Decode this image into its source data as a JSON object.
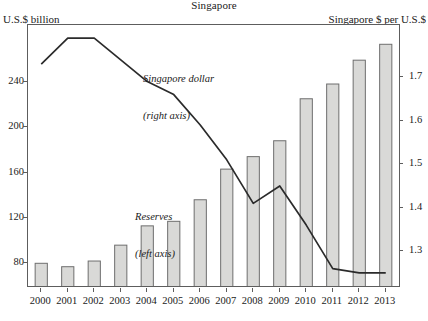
{
  "header": {
    "title": "Singapore",
    "left_axis_label": "U.S.$ billion",
    "right_axis_label": "Singapore $ per U.S.$"
  },
  "annotations": {
    "line_series": "Singapore dollar",
    "line_series_axis": "(right axis)",
    "bar_series": "Reserves",
    "bar_series_axis": "(left axis)"
  },
  "colors": {
    "bar_fill": "#d9d9d7",
    "bar_stroke": "#6e6e6e",
    "line_stroke": "#2b2b2b",
    "frame": "#5d5d5d",
    "text": "#1a1a1a"
  },
  "chart_data": {
    "type": "bar",
    "title": "Singapore",
    "xlabel": "",
    "ylabel": "U.S.$ billion",
    "y2label": "Singapore $ per U.S.$",
    "grid": false,
    "legend": "inline-annotations",
    "categories": [
      "2000",
      "2001",
      "2002",
      "2003",
      "2004",
      "2005",
      "2006",
      "2007",
      "2008",
      "2009",
      "2010",
      "2011",
      "2012",
      "2013"
    ],
    "ylim": [
      60,
      290
    ],
    "yticks": [
      80,
      120,
      160,
      200,
      240
    ],
    "y2lim": [
      1.22,
      1.82
    ],
    "y2ticks": [
      1.3,
      1.4,
      1.5,
      1.6,
      1.7
    ],
    "ytick_labels": [
      "80",
      "120",
      "160",
      "200",
      "240"
    ],
    "y2tick_labels": [
      "1.3",
      "1.4",
      "1.5",
      "1.6",
      "1.7"
    ],
    "series": [
      {
        "name": "Reserves",
        "type": "bar",
        "axis": "left",
        "values": [
          80,
          77,
          82,
          96,
          113,
          117,
          136,
          163,
          174,
          188,
          225,
          238,
          259,
          273
        ]
      },
      {
        "name": "Singapore dollar",
        "type": "line",
        "axis": "right",
        "values": [
          1.73,
          1.79,
          1.79,
          1.74,
          1.69,
          1.66,
          1.59,
          1.51,
          1.41,
          1.45,
          1.36,
          1.26,
          1.25,
          1.25
        ]
      }
    ]
  }
}
